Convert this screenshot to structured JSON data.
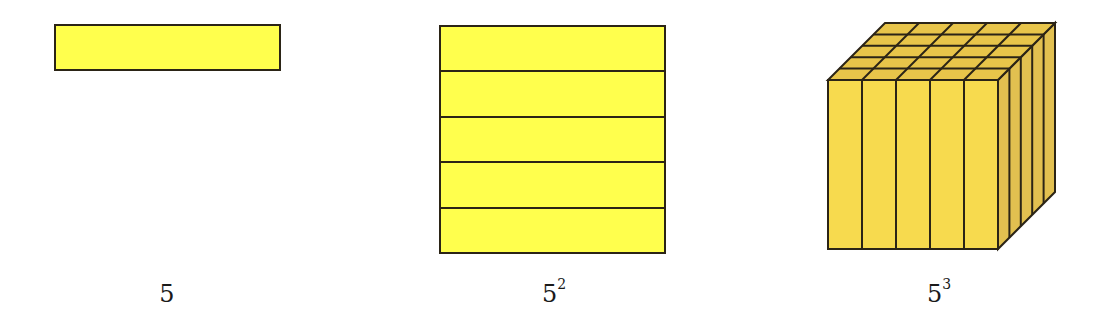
{
  "figures": [
    {
      "id": "bar",
      "label_base": "5",
      "label_exp": "",
      "description": "1 row of length 5"
    },
    {
      "id": "square",
      "label_base": "5",
      "label_exp": "2",
      "description": "5 rows stacked into a square"
    },
    {
      "id": "cube",
      "label_base": "5",
      "label_exp": "3",
      "description": "5x5 columns forming a cube"
    }
  ],
  "colors": {
    "bar_fill": "#FFFF4D",
    "square_fill": "#FFFF4D",
    "cube_front": "#F7DA4E",
    "cube_top": "#E8C54A",
    "cube_side": "#E2C050",
    "stroke": "#2B2416"
  }
}
